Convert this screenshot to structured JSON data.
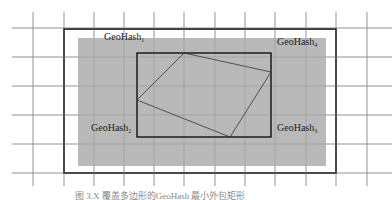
{
  "diagram": {
    "grid": {
      "x_lines": [
        33,
        64,
        94,
        124,
        154,
        184,
        215,
        245,
        275,
        306,
        336,
        367
      ],
      "y_lines": [
        28,
        57,
        86,
        115,
        144,
        173
      ],
      "color": "#9a9a9a"
    },
    "outer_box": {
      "x": 64,
      "y": 29,
      "w": 272,
      "h": 144,
      "stroke": "#111111"
    },
    "shaded_region": {
      "x": 78,
      "y": 38,
      "w": 248,
      "h": 128,
      "fill": "#b9b9b9"
    },
    "inner_box": {
      "x": 137,
      "y": 53,
      "w": 134,
      "h": 84,
      "stroke": "#111111"
    },
    "polygon": {
      "points": "184,53 271,72 230,137 137,100",
      "stroke": "#333333"
    },
    "labels": [
      {
        "base": "GeoHash",
        "sub": "1",
        "x": 104,
        "y": 41
      },
      {
        "base": "GeoHash",
        "sub": "4",
        "x": 277,
        "y": 46
      },
      {
        "base": "GeoHash",
        "sub": "2",
        "x": 91,
        "y": 132
      },
      {
        "base": "GeoHash",
        "sub": "3",
        "x": 277,
        "y": 132
      }
    ],
    "caption": "图 3.X 覆盖多边形的GeoHash 最小外包矩形"
  }
}
